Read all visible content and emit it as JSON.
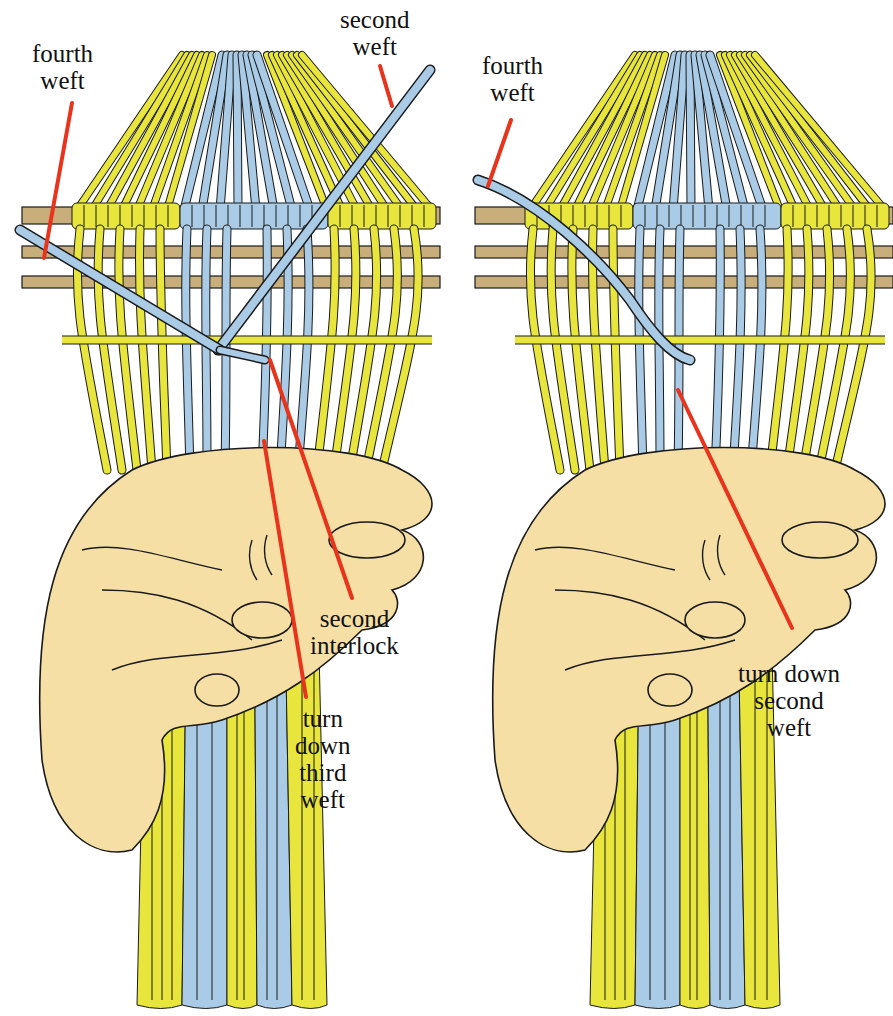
{
  "figure": {
    "type": "weaving-technique-illustration",
    "colors": {
      "yellow_warp": "#E8E63C",
      "blue_warp": "#A9CBE6",
      "stick": "#C8AE7A",
      "hand": "#F5DFA4",
      "pointer": "#E8341C",
      "outline": "#1A1A1A"
    },
    "panels": [
      {
        "id": "left",
        "labels": [
          {
            "text": "fourth\nweft",
            "x": 32,
            "y": 40
          },
          {
            "text": "second\nweft",
            "x": 340,
            "y": 6
          },
          {
            "text": "second\ninterlock",
            "x": 310,
            "y": 605
          },
          {
            "text": "turn\ndown\nthird\nweft",
            "x": 295,
            "y": 705
          }
        ]
      },
      {
        "id": "right",
        "labels": [
          {
            "text": "fourth\nweft",
            "x": 482,
            "y": 52
          },
          {
            "text": "turn down\nsecond\nweft",
            "x": 738,
            "y": 660
          }
        ]
      }
    ]
  }
}
